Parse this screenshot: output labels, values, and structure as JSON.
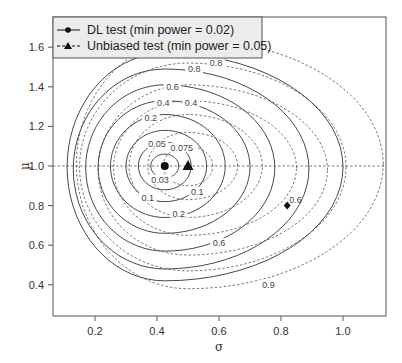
{
  "chart_data": {
    "type": "contour",
    "title": "",
    "xlabel": "σ",
    "ylabel": "μ",
    "xlim": [
      0.07,
      1.14
    ],
    "ylim": [
      0.25,
      1.76
    ],
    "x_ticks": [
      0.2,
      0.4,
      0.6,
      0.8,
      1.0
    ],
    "x_tick_labels": [
      "0.2",
      "0.4",
      "0.6",
      "0.8",
      "1.0"
    ],
    "y_ticks": [
      0.4,
      0.6,
      0.8,
      1.0,
      1.2,
      1.4,
      1.6
    ],
    "y_tick_labels": [
      "0.4",
      "0.6",
      "0.8",
      "1.0",
      "1.2",
      "1.4",
      "1.6"
    ],
    "reference_line": {
      "axis": "y",
      "value": 1.0,
      "style": "dashed"
    },
    "legend": {
      "position": "top-left",
      "entries": [
        {
          "label": "DL test (min power = 0.02)",
          "line": "solid",
          "marker": "circle"
        },
        {
          "label": "Unbiased test (min power = 0.05)",
          "line": "dashed",
          "marker": "triangle"
        }
      ]
    },
    "series": [
      {
        "name": "DL test (min power = 0.02)",
        "line": "solid",
        "min_point": {
          "sigma": 0.425,
          "mu": 1.0,
          "marker": "circle"
        },
        "contour_levels": [
          0.03,
          0.05,
          0.1,
          0.2,
          0.4,
          0.6,
          0.8,
          0.9
        ],
        "contours": [
          {
            "level": 0.03,
            "sigma_left": 0.38,
            "sigma_right": 0.47,
            "mu_low": 0.94,
            "mu_high": 1.06,
            "label": "0.03",
            "label_sigma": 0.41,
            "label_mu": 0.93
          },
          {
            "level": 0.05,
            "sigma_left": 0.34,
            "sigma_right": 0.51,
            "mu_low": 0.88,
            "mu_high": 1.12,
            "label": "0.05",
            "label_sigma": 0.4,
            "label_mu": 1.11
          },
          {
            "level": 0.1,
            "sigma_left": 0.3,
            "sigma_right": 0.56,
            "mu_low": 0.82,
            "mu_high": 1.18,
            "label": "0.1",
            "label_sigma": 0.37,
            "label_mu": 0.84
          },
          {
            "level": 0.2,
            "sigma_left": 0.25,
            "sigma_right": 0.62,
            "mu_low": 0.74,
            "mu_high": 1.26,
            "label": "0.2",
            "label_sigma": 0.38,
            "label_mu": 1.24
          },
          {
            "level": 0.4,
            "sigma_left": 0.21,
            "sigma_right": 0.7,
            "mu_low": 0.66,
            "mu_high": 1.33,
            "label": "0.4",
            "label_sigma": 0.42,
            "label_mu": 1.32
          },
          {
            "level": 0.6,
            "sigma_left": 0.17,
            "sigma_right": 0.78,
            "mu_low": 0.57,
            "mu_high": 1.41,
            "label": "0.6",
            "label_sigma": 0.45,
            "label_mu": 1.4
          },
          {
            "level": 0.8,
            "sigma_left": 0.13,
            "sigma_right": 0.89,
            "mu_low": 0.48,
            "mu_high": 1.49,
            "label": "0.8",
            "label_sigma": 0.52,
            "label_mu": 1.49
          },
          {
            "level": 0.9,
            "sigma_left": 0.11,
            "sigma_right": 1.0,
            "mu_low": 0.42,
            "mu_high": 1.57,
            "label": "",
            "label_sigma": null,
            "label_mu": null
          }
        ]
      },
      {
        "name": "Unbiased test (min power = 0.05)",
        "line": "dashed",
        "min_point": {
          "sigma": 0.5,
          "mu": 1.0,
          "marker": "triangle"
        },
        "contour_levels": [
          0.075,
          0.1,
          0.2,
          0.4,
          0.6,
          0.8,
          0.9
        ],
        "contours": [
          {
            "level": 0.075,
            "sigma_left": 0.42,
            "sigma_right": 0.58,
            "mu_low": 0.9,
            "mu_high": 1.1,
            "label": "0.075",
            "label_sigma": 0.48,
            "label_mu": 1.09
          },
          {
            "level": 0.1,
            "sigma_left": 0.37,
            "sigma_right": 0.66,
            "mu_low": 0.83,
            "mu_high": 1.17,
            "label": "0.1",
            "label_sigma": 0.53,
            "label_mu": 0.87
          },
          {
            "level": 0.2,
            "sigma_left": 0.31,
            "sigma_right": 0.74,
            "mu_low": 0.74,
            "mu_high": 1.26,
            "label": "0.2",
            "label_sigma": 0.47,
            "label_mu": 0.76
          },
          {
            "level": 0.4,
            "sigma_left": 0.26,
            "sigma_right": 0.85,
            "mu_low": 0.65,
            "mu_high": 1.33,
            "label": "0.4",
            "label_sigma": 0.51,
            "label_mu": 1.32
          },
          {
            "level": 0.6,
            "sigma_left": 0.21,
            "sigma_right": 0.95,
            "mu_low": 0.55,
            "mu_high": 1.41,
            "label": "0.6",
            "label_sigma": 0.6,
            "label_mu": 0.61
          },
          {
            "level": 0.8,
            "sigma_left": 0.15,
            "sigma_right": 1.01,
            "mu_low": 0.47,
            "mu_high": 1.52,
            "label": "0.8",
            "label_sigma": 0.59,
            "label_mu": 1.52
          },
          {
            "level": 0.9,
            "sigma_left": 0.14,
            "sigma_right": 1.13,
            "mu_low": 0.38,
            "mu_high": 1.64,
            "label": "0.9",
            "label_sigma": 0.76,
            "label_mu": 0.4
          }
        ]
      }
    ],
    "annotations": [
      {
        "type": "point",
        "marker": "diamond",
        "sigma": 0.82,
        "mu": 0.8,
        "label": "0.6"
      }
    ]
  }
}
